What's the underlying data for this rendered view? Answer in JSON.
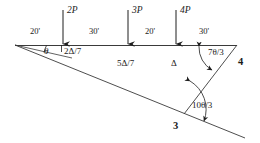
{
  "figure": {
    "type": "structural-beam-diagram",
    "line_color": "#2b2b2b",
    "text_color": "#1a1a1a",
    "background": "#ffffff"
  },
  "loads": [
    {
      "id": "load-2p",
      "label": "2P",
      "x": 63,
      "arrow_top": 10,
      "arrow_bottom": 45,
      "label_x": 67,
      "label_y": 9
    },
    {
      "id": "load-3p",
      "label": "3P",
      "x": 128,
      "arrow_top": 10,
      "arrow_bottom": 45,
      "label_x": 132,
      "label_y": 9
    },
    {
      "id": "load-4p",
      "label": "4P",
      "x": 176,
      "arrow_top": 10,
      "arrow_bottom": 45,
      "label_x": 180,
      "label_y": 9
    }
  ],
  "dimensions": [
    {
      "id": "dim-1",
      "label": "20'",
      "x": 30,
      "y": 27
    },
    {
      "id": "dim-2",
      "label": "30'",
      "x": 89,
      "y": 27
    },
    {
      "id": "dim-3",
      "label": "20'",
      "x": 145,
      "y": 27
    },
    {
      "id": "dim-4",
      "label": "30'",
      "x": 199,
      "y": 27
    }
  ],
  "deflections": [
    {
      "id": "defl-1",
      "label": "2Δ/7",
      "x": 64,
      "y": 48
    },
    {
      "id": "defl-2",
      "label": "5Δ/7",
      "x": 119,
      "y": 62
    },
    {
      "id": "defl-3",
      "label": "Δ",
      "x": 172,
      "y": 62
    }
  ],
  "angles": [
    {
      "id": "angle-theta",
      "label": "θ",
      "x": 44,
      "y": 48
    },
    {
      "id": "angle-7theta-3",
      "label": "7θ/3",
      "x": 209,
      "y": 50
    },
    {
      "id": "angle-10theta-3",
      "label": "10θ/3",
      "x": 194,
      "y": 104
    }
  ],
  "nodes": [
    {
      "id": "node-4",
      "label": "4",
      "x": 238,
      "y": 57
    },
    {
      "id": "node-3",
      "label": "3",
      "x": 173,
      "y": 123
    }
  ],
  "geometry": {
    "beam": {
      "x1": 15,
      "y1": 45,
      "x2": 237,
      "y2": 45
    },
    "lower_chord": {
      "x1": 15,
      "y1": 45,
      "x2": 243,
      "y2": 137
    },
    "diagonal": {
      "x1": 237,
      "y1": 45,
      "x2": 185,
      "y2": 113
    },
    "short_chord": {
      "x1": 15,
      "y1": 45,
      "x2": 70,
      "y2": 57
    }
  }
}
